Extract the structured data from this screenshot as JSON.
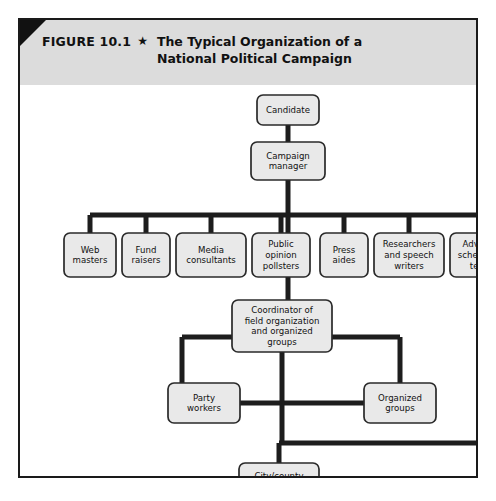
{
  "figure": {
    "label": "FIGURE 10.1",
    "star": "★",
    "title": "The Typical Organization of a National Political Campaign"
  },
  "colors": {
    "box_fill": "#e9e9e9",
    "box_border": "#2a2a2a",
    "connector": "#1d1d1d",
    "header_band": "#dcdcdc",
    "frame_border": "#1a1a1a",
    "corner_fold": "#111111",
    "page_background": "#ffffff",
    "text": "#111111"
  },
  "chart_data": {
    "type": "diagram",
    "title": "The Typical Organization of a National Political Campaign",
    "diagram_kind": "organization-chart",
    "nodes": [
      {
        "id": "candidate",
        "label": "Candidate",
        "lines": [
          "Candidate"
        ],
        "level": 0,
        "x": 237,
        "y": 10,
        "w": 62,
        "h": 30
      },
      {
        "id": "manager",
        "label": "Campaign manager",
        "lines": [
          "Campaign",
          "manager"
        ],
        "level": 1,
        "x": 231,
        "y": 57,
        "w": 74,
        "h": 38
      },
      {
        "id": "web",
        "label": "Web masters",
        "lines": [
          "Web",
          "masters"
        ],
        "level": 2,
        "x": 44,
        "y": 148,
        "w": 52,
        "h": 44
      },
      {
        "id": "fund",
        "label": "Fund raisers",
        "lines": [
          "Fund",
          "raisers"
        ],
        "level": 2,
        "x": 102,
        "y": 148,
        "w": 48,
        "h": 44
      },
      {
        "id": "media",
        "label": "Media consultants",
        "lines": [
          "Media",
          "consultants"
        ],
        "level": 2,
        "x": 156,
        "y": 148,
        "w": 70,
        "h": 44
      },
      {
        "id": "pollsters",
        "label": "Public opinion pollsters",
        "lines": [
          "Public",
          "opinion",
          "pollsters"
        ],
        "level": 2,
        "x": 232,
        "y": 148,
        "w": 58,
        "h": 44
      },
      {
        "id": "press",
        "label": "Press aides",
        "lines": [
          "Press",
          "aides"
        ],
        "level": 2,
        "x": 300,
        "y": 148,
        "w": 48,
        "h": 44
      },
      {
        "id": "research",
        "label": "Researchers and speech writers",
        "lines": [
          "Researchers",
          "and speech",
          "writers"
        ],
        "level": 2,
        "x": 354,
        "y": 148,
        "w": 70,
        "h": 44
      },
      {
        "id": "advance",
        "label": "Advance scheduling team",
        "lines": [
          "Advance",
          "scheduling",
          "team"
        ],
        "level": 2,
        "x": 430,
        "y": 148,
        "w": 62,
        "h": 44
      },
      {
        "id": "coordinator",
        "label": "Coordinator of field organization and organized groups",
        "lines": [
          "Coordinator of",
          "field organization",
          "and organized",
          "groups"
        ],
        "level": 3,
        "x": 212,
        "y": 215,
        "w": 100,
        "h": 52
      },
      {
        "id": "party",
        "label": "Party workers",
        "lines": [
          "Party",
          "workers"
        ],
        "level": 4,
        "x": 148,
        "y": 298,
        "w": 72,
        "h": 40
      },
      {
        "id": "organized",
        "label": "Organized groups",
        "lines": [
          "Organized",
          "groups"
        ],
        "level": 4,
        "x": 344,
        "y": 298,
        "w": 72,
        "h": 40
      },
      {
        "id": "fieldoffice",
        "label": "City/county field offices",
        "lines": [
          "City/county",
          "field",
          "offices"
        ],
        "level": 5,
        "x": 219,
        "y": 378,
        "w": 80,
        "h": 48
      }
    ],
    "edges": [
      {
        "from": "candidate",
        "to": "manager",
        "style": "vertical"
      },
      {
        "from": "manager",
        "to": "bus",
        "style": "vertical"
      },
      {
        "from": "bus",
        "to": "web",
        "style": "drop"
      },
      {
        "from": "bus",
        "to": "fund",
        "style": "drop"
      },
      {
        "from": "bus",
        "to": "media",
        "style": "drop"
      },
      {
        "from": "bus",
        "to": "pollsters",
        "style": "drop"
      },
      {
        "from": "bus",
        "to": "press",
        "style": "drop"
      },
      {
        "from": "bus",
        "to": "research",
        "style": "drop"
      },
      {
        "from": "bus",
        "to": "advance",
        "style": "drop"
      },
      {
        "from": "bus",
        "to": "coordinator",
        "style": "center-drop"
      },
      {
        "from": "coordinator",
        "to": "party",
        "style": "elbow-left"
      },
      {
        "from": "coordinator",
        "to": "organized",
        "style": "elbow-right"
      },
      {
        "from": "party",
        "to": "organized",
        "style": "horizontal-bus"
      },
      {
        "from": "coordinator",
        "to": "fieldoffice",
        "style": "vertical"
      },
      {
        "from": "advance",
        "to": "fieldoffice",
        "style": "elbow-long-right"
      }
    ]
  }
}
